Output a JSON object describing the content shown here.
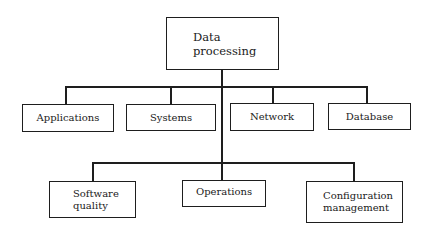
{
  "diagram": {
    "type": "org-chart",
    "root": {
      "label": "Data\nprocessing"
    },
    "level1": [
      {
        "label": "Applications"
      },
      {
        "label": "Systems"
      },
      {
        "label": "Network"
      },
      {
        "label": "Database"
      }
    ],
    "level2": [
      {
        "label": "Software\nquality"
      },
      {
        "label": "Operations"
      },
      {
        "label": "Configuration\nmanagement"
      }
    ],
    "colors": {
      "line": "#1e1e1e",
      "background": "#ffffff",
      "text": "#1a1a1a"
    }
  }
}
